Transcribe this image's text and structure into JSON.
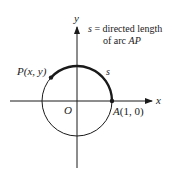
{
  "diagram": {
    "axes": {
      "x_label": "x",
      "y_label": "y",
      "origin_label": "O"
    },
    "points": {
      "P": {
        "name": "P",
        "coords": "(x, y)"
      },
      "A": {
        "name": "A",
        "coords": "(1, 0)"
      }
    },
    "arc_label": "s",
    "annotation": {
      "line1": "s = directed length",
      "line1_var": "s",
      "line1_rest": " = directed length",
      "line2_prefix": "of arc ",
      "line2_var": "AP"
    },
    "colors": {
      "ink": "#1a1a1a",
      "background": "#ffffff"
    }
  }
}
